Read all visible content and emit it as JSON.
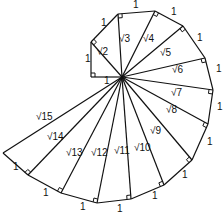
{
  "center": [
    122,
    77
  ],
  "colors": {
    "stroke": "#111111",
    "background": "#ffffff"
  },
  "vertices": [
    [
      91,
      77
    ],
    [
      91,
      42
    ],
    [
      118,
      14
    ],
    [
      155,
      11
    ],
    [
      183,
      26
    ],
    [
      205,
      58
    ],
    [
      213,
      90
    ],
    [
      208,
      124
    ],
    [
      192,
      160
    ],
    [
      164,
      185
    ],
    [
      131,
      199
    ],
    [
      97,
      203
    ],
    [
      61,
      193
    ],
    [
      28,
      175
    ],
    [
      3,
      153
    ]
  ],
  "hypotenuse_labels": [
    {
      "text": "√2",
      "x": 97,
      "y": 55
    },
    {
      "text": "√3",
      "x": 119,
      "y": 42
    },
    {
      "text": "√4",
      "x": 143,
      "y": 42
    },
    {
      "text": "√5",
      "x": 160,
      "y": 56
    },
    {
      "text": "√6",
      "x": 172,
      "y": 73
    },
    {
      "text": "√7",
      "x": 171,
      "y": 96
    },
    {
      "text": "√8",
      "x": 166,
      "y": 113
    },
    {
      "text": "√9",
      "x": 150,
      "y": 134
    },
    {
      "text": "√10",
      "x": 134,
      "y": 151
    },
    {
      "text": "√11",
      "x": 114,
      "y": 154
    },
    {
      "text": "√12",
      "x": 91,
      "y": 156
    },
    {
      "text": "√13",
      "x": 66,
      "y": 156
    },
    {
      "text": "√14",
      "x": 47,
      "y": 140
    },
    {
      "text": "√15",
      "x": 36,
      "y": 120
    }
  ],
  "leg_label": "1",
  "leg_labels": [
    {
      "x": 104,
      "y": 84
    },
    {
      "x": 85,
      "y": 62
    },
    {
      "x": 101,
      "y": 26
    },
    {
      "x": 133,
      "y": 8
    },
    {
      "x": 171,
      "y": 15
    },
    {
      "x": 197,
      "y": 41
    },
    {
      "x": 216,
      "y": 72
    },
    {
      "x": 217,
      "y": 110
    },
    {
      "x": 207,
      "y": 145
    },
    {
      "x": 182,
      "y": 178
    },
    {
      "x": 152,
      "y": 199
    },
    {
      "x": 117,
      "y": 212
    },
    {
      "x": 80,
      "y": 210
    },
    {
      "x": 43,
      "y": 196
    },
    {
      "x": 13,
      "y": 170
    }
  ]
}
